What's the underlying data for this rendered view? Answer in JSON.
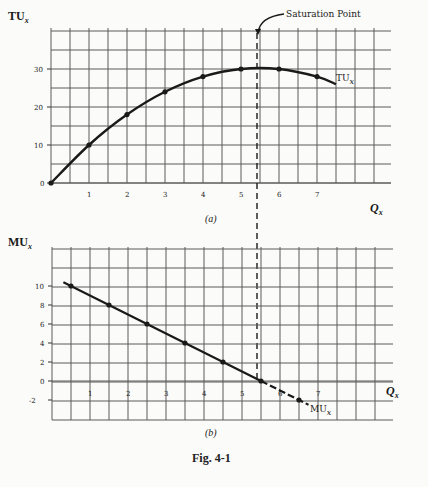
{
  "figure": {
    "caption": "Fig. 4-1"
  },
  "chart_data": [
    {
      "type": "line",
      "panel_label": "(a)",
      "title": "",
      "ylabel": "TU",
      "ylabel_sub": "x",
      "xlabel": "Q",
      "xlabel_sub": "x",
      "series": [
        {
          "name": "TUx",
          "x": [
            0,
            1,
            2,
            3,
            4,
            5,
            6,
            7
          ],
          "values": [
            0,
            10,
            18,
            24,
            28,
            30,
            30,
            28
          ]
        }
      ],
      "x_ticks": [
        "1",
        "2",
        "3",
        "4",
        "5",
        "6",
        "7"
      ],
      "y_ticks": [
        "0",
        "10",
        "20",
        "30"
      ],
      "xlim": [
        0,
        9
      ],
      "ylim": [
        0,
        40
      ],
      "grid": true,
      "annotations": [
        {
          "text": "Saturation Point",
          "x": 5.5,
          "y": 30
        },
        {
          "text": "TUx",
          "label": "TU",
          "sub": "x"
        }
      ],
      "vertical_dashed_line_x": 5.5
    },
    {
      "type": "line",
      "panel_label": "(b)",
      "title": "",
      "ylabel": "MU",
      "ylabel_sub": "x",
      "xlabel": "Q",
      "xlabel_sub": "x",
      "series": [
        {
          "name": "MUx",
          "x": [
            0.5,
            1.5,
            2.5,
            3.5,
            4.5,
            5.5,
            6.5
          ],
          "values": [
            10,
            8,
            6,
            4,
            2,
            0,
            -2
          ]
        }
      ],
      "x_ticks": [
        "1",
        "2",
        "3",
        "4",
        "5",
        "6",
        "7"
      ],
      "y_ticks": [
        "-2",
        "0",
        "2",
        "4",
        "6",
        "8",
        "10"
      ],
      "xlim": [
        0,
        9
      ],
      "ylim": [
        -4,
        14
      ],
      "grid": true,
      "annotations": [
        {
          "text": "MUx",
          "label": "MU",
          "sub": "x"
        }
      ],
      "vertical_dashed_line_x": 5.5
    }
  ],
  "labels": {
    "tu_axis": "TU",
    "mu_axis": "MU",
    "q_axis": "Q",
    "sub_x": "x",
    "panel_a": "(a)",
    "panel_b": "(b)",
    "saturation": "Saturation Point",
    "tu_curve": "TU",
    "mu_curve": "MU"
  }
}
